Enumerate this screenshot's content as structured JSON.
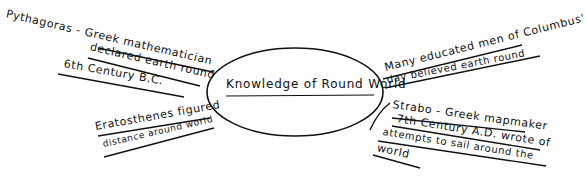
{
  "diagram": {
    "type": "mind-map",
    "style": "hand-drawn",
    "center": {
      "label": "Knowledge of Round World",
      "shape": "ellipse"
    },
    "branches": [
      {
        "id": "pythagoras",
        "position": "upper-left",
        "lines": [
          "Pythagoras - Greek mathematician",
          "declared earth round",
          "6th Century B.C."
        ]
      },
      {
        "id": "eratosthenes",
        "position": "lower-left",
        "lines": [
          "Eratosthenes figured",
          "distance around world"
        ]
      },
      {
        "id": "columbus",
        "position": "upper-right",
        "lines": [
          "Many educated men of Columbus'",
          "day believed earth round"
        ]
      },
      {
        "id": "strabo",
        "position": "lower-right",
        "lines": [
          "Strabo - Greek mapmaker",
          "7th Century A.D. wrote of",
          "attempts to sail around the",
          "world"
        ]
      }
    ],
    "colors": {
      "ink": "#111111",
      "background": "#ffffff"
    }
  }
}
